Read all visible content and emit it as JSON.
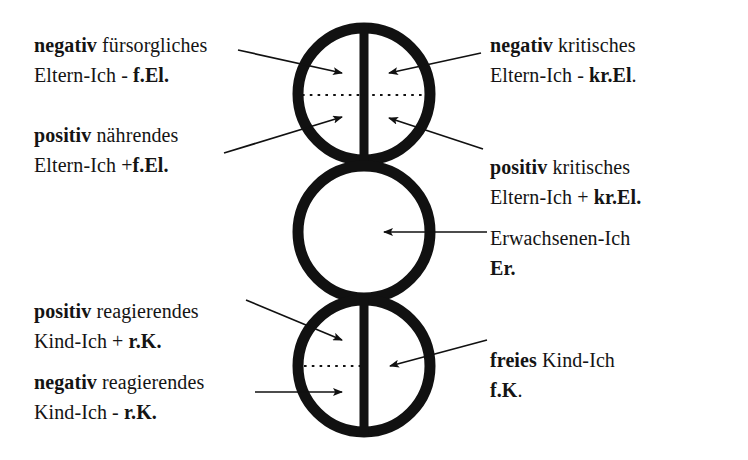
{
  "diagram": {
    "stroke_color": "#111111",
    "background_color": "#ffffff",
    "circles": [
      {
        "name": "eltern-ich",
        "divided": true,
        "dotted_line": "full"
      },
      {
        "name": "erwachsenen-ich",
        "divided": false,
        "dotted_line": "none"
      },
      {
        "name": "kind-ich",
        "divided": true,
        "dotted_line": "left"
      }
    ]
  },
  "labels": {
    "top_left_upper": {
      "line1_bold": "negativ",
      "line1_rest": " fürsorgliches",
      "line2_plain": "Eltern-Ich - ",
      "line2_bold": "f.El."
    },
    "top_left_lower": {
      "line1_bold": "positiv",
      "line1_rest": " nährendes",
      "line2_plain": "Eltern-Ich +",
      "line2_bold": "f.El."
    },
    "top_right_upper": {
      "line1_bold": "negativ",
      "line1_rest": " kritisches",
      "line2_plain": "Eltern-Ich - ",
      "line2_bold": "kr.El",
      "line2_tail": "."
    },
    "top_right_lower": {
      "line1_bold": "positiv",
      "line1_rest": " kritisches",
      "line2_plain": "Eltern-Ich + ",
      "line2_bold": "kr.El."
    },
    "middle_right": {
      "line1_plain": "Erwachsenen-Ich",
      "line2_bold": "Er."
    },
    "bottom_left_upper": {
      "line1_bold": "positiv",
      "line1_rest": " reagierendes",
      "line2_plain": "Kind-Ich + ",
      "line2_bold": "r.K."
    },
    "bottom_left_lower": {
      "line1_bold": "negativ",
      "line1_rest": " reagierendes",
      "line2_plain": "Kind-Ich - ",
      "line2_bold": "r.K."
    },
    "bottom_right": {
      "line1_bold": "freies",
      "line1_rest": " Kind-Ich",
      "line2_bold": "f.K",
      "line2_tail": "."
    }
  }
}
